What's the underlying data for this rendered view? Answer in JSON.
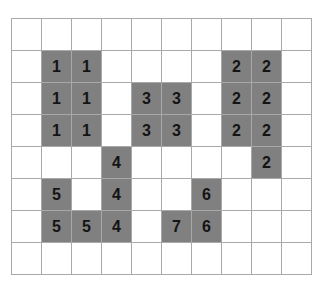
{
  "puzzle": {
    "title": "Grid Region Puzzle",
    "columns": 10,
    "rows": 8,
    "colors": {
      "background": "#ffffff",
      "grid_line": "#a9a9a9",
      "filled_cell": "#808080",
      "digit": "#141414"
    },
    "legend": {
      "filled_description": "shaded cell with region number",
      "empty_description": "blank white cell"
    },
    "regions": [
      {
        "id": 1,
        "label": "1",
        "cell_count": 6,
        "cells": [
          [
            1,
            1
          ],
          [
            1,
            2
          ],
          [
            2,
            1
          ],
          [
            2,
            2
          ],
          [
            3,
            1
          ],
          [
            3,
            2
          ]
        ]
      },
      {
        "id": 2,
        "label": "2",
        "cell_count": 7,
        "cells": [
          [
            1,
            7
          ],
          [
            1,
            8
          ],
          [
            2,
            7
          ],
          [
            2,
            8
          ],
          [
            3,
            7
          ],
          [
            3,
            8
          ],
          [
            4,
            8
          ]
        ]
      },
      {
        "id": 3,
        "label": "3",
        "cell_count": 4,
        "cells": [
          [
            2,
            4
          ],
          [
            2,
            5
          ],
          [
            3,
            4
          ],
          [
            3,
            5
          ]
        ]
      },
      {
        "id": 4,
        "label": "4",
        "cell_count": 3,
        "cells": [
          [
            4,
            3
          ],
          [
            5,
            3
          ],
          [
            6,
            3
          ]
        ]
      },
      {
        "id": 5,
        "label": "5",
        "cell_count": 3,
        "cells": [
          [
            5,
            1
          ],
          [
            6,
            1
          ],
          [
            6,
            2
          ]
        ]
      },
      {
        "id": 6,
        "label": "6",
        "cell_count": 2,
        "cells": [
          [
            5,
            6
          ],
          [
            6,
            6
          ]
        ]
      },
      {
        "id": 7,
        "label": "7",
        "cell_count": 1,
        "cells": [
          [
            6,
            5
          ]
        ]
      }
    ],
    "grid": [
      [
        "",
        "",
        "",
        "",
        "",
        "",
        "",
        "",
        "",
        ""
      ],
      [
        "",
        "1",
        "1",
        "",
        "",
        "",
        "",
        "2",
        "2",
        ""
      ],
      [
        "",
        "1",
        "1",
        "",
        "3",
        "3",
        "",
        "2",
        "2",
        ""
      ],
      [
        "",
        "1",
        "1",
        "",
        "3",
        "3",
        "",
        "2",
        "2",
        ""
      ],
      [
        "",
        "",
        "",
        "4",
        "",
        "",
        "",
        "",
        "2",
        ""
      ],
      [
        "",
        "5",
        "",
        "4",
        "",
        "",
        "6",
        "",
        "",
        ""
      ],
      [
        "",
        "5",
        "5",
        "4",
        "",
        "7",
        "6",
        "",
        "",
        ""
      ],
      [
        "",
        "",
        "",
        "",
        "",
        "",
        "",
        "",
        "",
        ""
      ]
    ]
  }
}
